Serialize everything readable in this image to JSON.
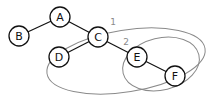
{
  "diagram": {
    "type": "tree",
    "colors": {
      "node_stroke": "#111111",
      "edge": "#111111",
      "group": "#8a8a8a",
      "background": "#ffffff"
    },
    "nodes": [
      {
        "id": "A",
        "label": "A",
        "x": 60,
        "y": 17
      },
      {
        "id": "B",
        "label": "B",
        "x": 19,
        "y": 36
      },
      {
        "id": "C",
        "label": "C",
        "x": 98,
        "y": 37
      },
      {
        "id": "D",
        "label": "D",
        "x": 59,
        "y": 57
      },
      {
        "id": "E",
        "label": "E",
        "x": 137,
        "y": 57
      },
      {
        "id": "F",
        "label": "F",
        "x": 175,
        "y": 76
      }
    ],
    "edges": [
      {
        "from": "A",
        "to": "B"
      },
      {
        "from": "A",
        "to": "C"
      },
      {
        "from": "C",
        "to": "D"
      },
      {
        "from": "C",
        "to": "E"
      },
      {
        "from": "E",
        "to": "F"
      }
    ],
    "groups": [
      {
        "label": "1",
        "contains": [
          "C",
          "D",
          "E",
          "F"
        ],
        "label_x": 113,
        "label_y": 22
      },
      {
        "label": "2",
        "contains": [
          "E",
          "F"
        ],
        "label_x": 126,
        "label_y": 42
      }
    ]
  }
}
